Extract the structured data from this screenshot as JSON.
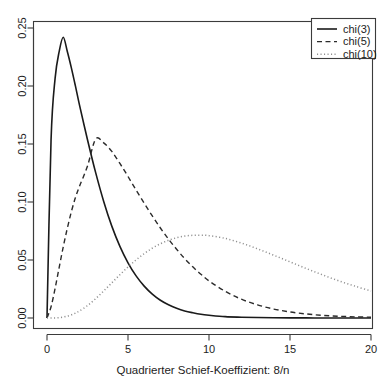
{
  "chart_data": {
    "type": "line",
    "title": "",
    "subtitle": "",
    "xlabel": "Quadrierter Schief-Koeffizient: 8/n",
    "ylabel": "",
    "xlim": [
      0,
      20
    ],
    "ylim": [
      0.0,
      0.25
    ],
    "grid": false,
    "legend_position": "top-right",
    "x_ticks": [
      "0",
      "5",
      "10",
      "15",
      "20"
    ],
    "x_tick_values": [
      0,
      5,
      10,
      15,
      20
    ],
    "y_ticks": [
      "0.00",
      "0.05",
      "0.10",
      "0.15",
      "0.20",
      "0.25"
    ],
    "y_tick_values": [
      0.0,
      0.05,
      0.1,
      0.15,
      0.2,
      0.25
    ],
    "x": [
      0.0,
      0.25,
      0.5,
      0.75,
      1.0,
      1.25,
      1.5,
      1.75,
      2.0,
      2.5,
      3.0,
      3.5,
      4.0,
      4.5,
      5.0,
      5.5,
      6.0,
      6.5,
      7.0,
      7.5,
      8.0,
      8.5,
      9.0,
      9.5,
      10.0,
      11.0,
      12.0,
      13.0,
      14.0,
      15.0,
      16.0,
      17.0,
      18.0,
      19.0,
      20.0
    ],
    "series": [
      {
        "name": "chi(3)",
        "label": "chi(3)",
        "linestyle": "solid",
        "color": "#1a1a1a",
        "peak_x": 1.0,
        "peak_y": 0.242,
        "values": [
          0.0,
          0.1534,
          0.2066,
          0.2296,
          0.242,
          0.23,
          0.2159,
          0.2003,
          0.184,
          0.1537,
          0.1255,
          0.1005,
          0.0792,
          0.0618,
          0.0476,
          0.0363,
          0.0275,
          0.0206,
          0.0153,
          0.0114,
          0.0084,
          0.0061,
          0.0045,
          0.0032,
          0.0024,
          0.0012,
          0.0007,
          0.0004,
          0.0002,
          0.0001,
          0.0001,
          0.0,
          0.0,
          0.0,
          0.0
        ]
      },
      {
        "name": "chi(5)",
        "label": "chi(5)",
        "linestyle": "dashed",
        "color": "#2b2b2b",
        "peak_x": 3.0,
        "peak_y": 0.1542,
        "values": [
          0.0,
          0.0097,
          0.0255,
          0.0435,
          0.0611,
          0.0771,
          0.0914,
          0.1036,
          0.1133,
          0.131,
          0.1542,
          0.151,
          0.1436,
          0.1332,
          0.122,
          0.1103,
          0.099,
          0.088,
          0.0776,
          0.068,
          0.0593,
          0.0512,
          0.0441,
          0.0377,
          0.032,
          0.023,
          0.0162,
          0.0113,
          0.0077,
          0.0052,
          0.0035,
          0.0023,
          0.0015,
          0.001,
          0.0007
        ]
      },
      {
        "name": "chi(10)",
        "label": "chi(10)",
        "linestyle": "dotted",
        "color": "#8f8f8f",
        "peak_x": 8.0,
        "peak_y": 0.0975,
        "values": [
          0.0,
          0.0,
          0.0001,
          0.0003,
          0.0008,
          0.0016,
          0.0027,
          0.0042,
          0.006,
          0.0107,
          0.0166,
          0.0233,
          0.0303,
          0.0373,
          0.044,
          0.0501,
          0.0555,
          0.0602,
          0.064,
          0.067,
          0.0692,
          0.0706,
          0.0713,
          0.0714,
          0.071,
          0.0686,
          0.0646,
          0.0596,
          0.0541,
          0.0484,
          0.0427,
          0.0372,
          0.0321,
          0.0275,
          0.0233
        ]
      }
    ]
  },
  "legend": {
    "entries": [
      {
        "label": "chi(3)",
        "style": "solid"
      },
      {
        "label": "chi(5)",
        "style": "dashed"
      },
      {
        "label": "chi(10)",
        "style": "dotted"
      }
    ]
  },
  "axes": {
    "x_title": "Quadrierter Schief-Koeffizient: 8/n",
    "y_title": ""
  }
}
